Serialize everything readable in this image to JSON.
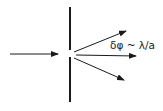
{
  "diagram": {
    "annotation": "δφ ~ λ/a",
    "elements": {
      "barrier": "opaque screen with slit of width a",
      "incident_arrow": "incoming plane wave direction",
      "diffracted_arrows": [
        "upper diffracted ray",
        "central ray",
        "lower diffracted ray"
      ]
    },
    "colors": {
      "line": "#1a1a1a",
      "background": "#ffffff"
    }
  }
}
